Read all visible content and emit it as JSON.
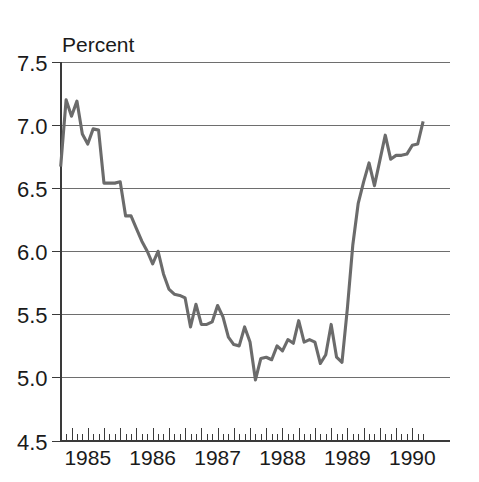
{
  "chart_data": {
    "type": "line",
    "title": "",
    "subtitle": "",
    "xlabel": "",
    "ylabel": "Percent",
    "ylim": [
      4.5,
      7.5
    ],
    "ytick_step": 0.5,
    "yticks": [
      "7.5",
      "7.0",
      "6.5",
      "6.0",
      "5.5",
      "5.0",
      "4.5"
    ],
    "ytick_values": [
      7.5,
      7.0,
      6.5,
      6.0,
      5.5,
      5.0,
      4.5
    ],
    "xticks": [
      "1985",
      "1986",
      "1987",
      "1988",
      "1989",
      "1990"
    ],
    "xtick_values": [
      1985,
      1986,
      1987,
      1988,
      1989,
      1990
    ],
    "xlim": [
      1984.58,
      1990.58
    ],
    "grid": "horizontal",
    "legend": "none",
    "line_color": "#6b6b6b",
    "background_color": "#ffffff",
    "axis_color": "#3a3a3a",
    "frequency": "monthly",
    "x_start": 1984.583,
    "x_step": 0.08333,
    "series": [
      {
        "name": "Percent",
        "color": "#6b6b6b",
        "values": [
          6.67,
          7.2,
          7.07,
          7.19,
          6.93,
          6.85,
          6.97,
          6.96,
          6.54,
          6.54,
          6.54,
          6.55,
          6.28,
          6.28,
          6.18,
          6.08,
          6.0,
          5.9,
          6.0,
          5.82,
          5.7,
          5.66,
          5.65,
          5.63,
          5.4,
          5.58,
          5.42,
          5.42,
          5.44,
          5.57,
          5.48,
          5.32,
          5.26,
          5.25,
          5.4,
          5.28,
          4.98,
          5.15,
          5.16,
          5.14,
          5.25,
          5.21,
          5.3,
          5.27,
          5.45,
          5.28,
          5.3,
          5.28,
          5.11,
          5.18,
          5.42,
          5.16,
          5.12,
          5.55,
          6.05,
          6.38,
          6.55,
          6.7,
          6.52,
          6.72,
          6.92,
          6.73,
          6.76,
          6.76,
          6.77,
          6.84,
          6.85,
          7.03
        ]
      }
    ],
    "annotations": []
  },
  "chart": {
    "y_axis_title": "Percent"
  }
}
